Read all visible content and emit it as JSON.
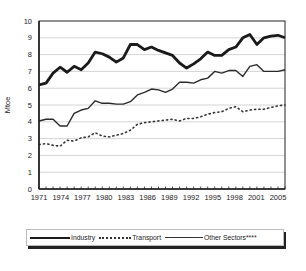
{
  "chart_data": {
    "type": "line",
    "title": "",
    "xlabel": "",
    "ylabel": "Mtoe",
    "ylim": [
      0,
      10
    ],
    "yticks": [
      0,
      1,
      2,
      3,
      4,
      5,
      6,
      7,
      8,
      9,
      10
    ],
    "xtick_labels": [
      "1971",
      "1974",
      "1977",
      "1980",
      "1983",
      "1986",
      "1989",
      "1992",
      "1995",
      "1998",
      "2001",
      "2005"
    ],
    "grid": true,
    "legend_position": "bottom",
    "x": [
      1971,
      1972,
      1973,
      1974,
      1975,
      1976,
      1977,
      1978,
      1979,
      1980,
      1981,
      1982,
      1983,
      1984,
      1985,
      1986,
      1987,
      1988,
      1989,
      1990,
      1991,
      1992,
      1993,
      1994,
      1995,
      1996,
      1997,
      1998,
      1999,
      2000,
      2001,
      2002,
      2003,
      2004,
      2005,
      2006
    ],
    "series": [
      {
        "name": "Industry",
        "style": "thick-solid",
        "values": [
          6.2,
          6.3,
          6.9,
          7.25,
          6.95,
          7.3,
          7.1,
          7.5,
          8.15,
          8.05,
          7.85,
          7.55,
          7.8,
          8.6,
          8.6,
          8.3,
          8.45,
          8.25,
          8.1,
          7.95,
          7.5,
          7.2,
          7.45,
          7.75,
          8.15,
          7.95,
          7.95,
          8.3,
          8.45,
          9.0,
          9.2,
          8.6,
          9.0,
          9.1,
          9.15,
          9.0
        ]
      },
      {
        "name": "Transport",
        "style": "dotted",
        "values": [
          2.65,
          2.7,
          2.6,
          2.55,
          2.9,
          2.85,
          3.05,
          3.1,
          3.35,
          3.15,
          3.1,
          3.2,
          3.3,
          3.5,
          3.85,
          3.95,
          4.0,
          4.05,
          4.1,
          4.15,
          4.05,
          4.2,
          4.2,
          4.3,
          4.45,
          4.55,
          4.6,
          4.8,
          4.9,
          4.6,
          4.7,
          4.75,
          4.75,
          4.85,
          4.95,
          5.0
        ]
      },
      {
        "name": "Other Sectors****",
        "style": "thin-solid",
        "values": [
          4.05,
          4.15,
          4.15,
          3.75,
          3.75,
          4.5,
          4.7,
          4.8,
          5.25,
          5.1,
          5.1,
          5.05,
          5.05,
          5.2,
          5.6,
          5.75,
          5.95,
          5.9,
          5.75,
          5.95,
          6.35,
          6.35,
          6.3,
          6.5,
          6.6,
          7.0,
          6.9,
          7.05,
          7.05,
          6.7,
          7.3,
          7.4,
          7.0,
          7.0,
          7.0,
          7.1
        ]
      }
    ]
  },
  "legend": {
    "items": [
      {
        "label": "Industry"
      },
      {
        "label": "Transport"
      },
      {
        "label": "Other Sectors****"
      }
    ]
  }
}
